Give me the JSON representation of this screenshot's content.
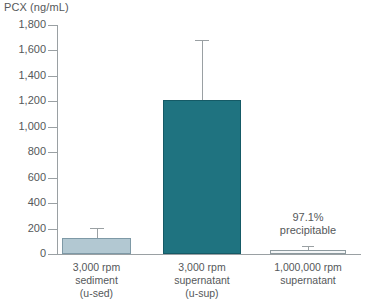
{
  "chart_data": {
    "type": "bar",
    "title": "",
    "ylabel": "PCX (ng/mL)",
    "xlabel": "",
    "ylim": [
      0,
      1800
    ],
    "grid": false,
    "legend": "none",
    "y_ticks": [
      {
        "value": 1800,
        "label": "1,800"
      },
      {
        "value": 1600,
        "label": "1,600"
      },
      {
        "value": 1400,
        "label": "1,400"
      },
      {
        "value": 1200,
        "label": "1,200"
      },
      {
        "value": 1000,
        "label": "1,000"
      },
      {
        "value": 800,
        "label": "800"
      },
      {
        "value": 600,
        "label": "600"
      },
      {
        "value": 400,
        "label": "400"
      },
      {
        "value": 200,
        "label": "200"
      },
      {
        "value": 0,
        "label": "0"
      }
    ],
    "categories": [
      {
        "lines": [
          "3,000 rpm",
          "sediment",
          "(u-sed)"
        ]
      },
      {
        "lines": [
          "3,000 rpm",
          "supernatant",
          "(u-sup)"
        ]
      },
      {
        "lines": [
          "1,000,000 rpm",
          "supernatant"
        ]
      }
    ],
    "series": [
      {
        "name": "PCX",
        "values": [
          126,
          1210,
          35
        ],
        "errors_upper": [
          204,
          1680,
          60
        ],
        "colors": [
          "#b2c8d2",
          "#1f7380",
          "#f4f6f7"
        ]
      }
    ],
    "annotations": [
      {
        "lines": [
          "97.1%",
          "precipitable"
        ],
        "target_category": "1,000,000 rpm supernatant"
      }
    ]
  },
  "colors": {
    "sediment_bar": "#b2c8d2",
    "supernatant_bar": "#1f7380",
    "ultracentrifuge_bar": "#f4f6f7",
    "axis": "#9aa0a3",
    "text": "#55585a"
  }
}
